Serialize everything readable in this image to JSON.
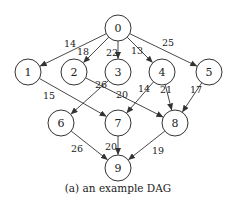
{
  "figure": {
    "caption": "(a) an example DAG",
    "node_radius": 13,
    "colors": {
      "stroke": "#333333",
      "fill": "#ffffff",
      "text": "#222222"
    },
    "nodes": [
      {
        "id": "0",
        "label": "0",
        "x": 118,
        "y": 28
      },
      {
        "id": "1",
        "label": "1",
        "x": 28,
        "y": 72
      },
      {
        "id": "2",
        "label": "2",
        "x": 74,
        "y": 72
      },
      {
        "id": "3",
        "label": "3",
        "x": 118,
        "y": 72
      },
      {
        "id": "4",
        "label": "4",
        "x": 162,
        "y": 72
      },
      {
        "id": "5",
        "label": "5",
        "x": 209,
        "y": 72
      },
      {
        "id": "6",
        "label": "6",
        "x": 61,
        "y": 123
      },
      {
        "id": "7",
        "label": "7",
        "x": 118,
        "y": 123
      },
      {
        "id": "8",
        "label": "8",
        "x": 175,
        "y": 123
      },
      {
        "id": "9",
        "label": "9",
        "x": 118,
        "y": 168
      }
    ],
    "edges": [
      {
        "from": "0",
        "to": "1",
        "weight": "14",
        "lx": 70,
        "ly": 43
      },
      {
        "from": "0",
        "to": "2",
        "weight": "18",
        "lx": 83,
        "ly": 51
      },
      {
        "from": "0",
        "to": "3",
        "weight": "22",
        "lx": 112,
        "ly": 52
      },
      {
        "from": "0",
        "to": "4",
        "weight": "13",
        "lx": 137,
        "ly": 50
      },
      {
        "from": "0",
        "to": "5",
        "weight": "25",
        "lx": 168,
        "ly": 42
      },
      {
        "from": "1",
        "to": "7",
        "weight": "15",
        "lx": 49,
        "ly": 95
      },
      {
        "from": "2",
        "to": "8",
        "weight": "20",
        "lx": 122,
        "ly": 94
      },
      {
        "from": "3",
        "to": "6",
        "weight": "26",
        "lx": 101,
        "ly": 84
      },
      {
        "from": "4",
        "to": "7",
        "weight": "14",
        "lx": 144,
        "ly": 88
      },
      {
        "from": "4",
        "to": "8",
        "weight": "21",
        "lx": 166,
        "ly": 89
      },
      {
        "from": "5",
        "to": "8",
        "weight": "17",
        "lx": 196,
        "ly": 89
      },
      {
        "from": "6",
        "to": "9",
        "weight": "26",
        "lx": 77,
        "ly": 148
      },
      {
        "from": "7",
        "to": "9",
        "weight": "20",
        "lx": 111,
        "ly": 146
      },
      {
        "from": "8",
        "to": "9",
        "weight": "19",
        "lx": 158,
        "ly": 150
      }
    ]
  }
}
